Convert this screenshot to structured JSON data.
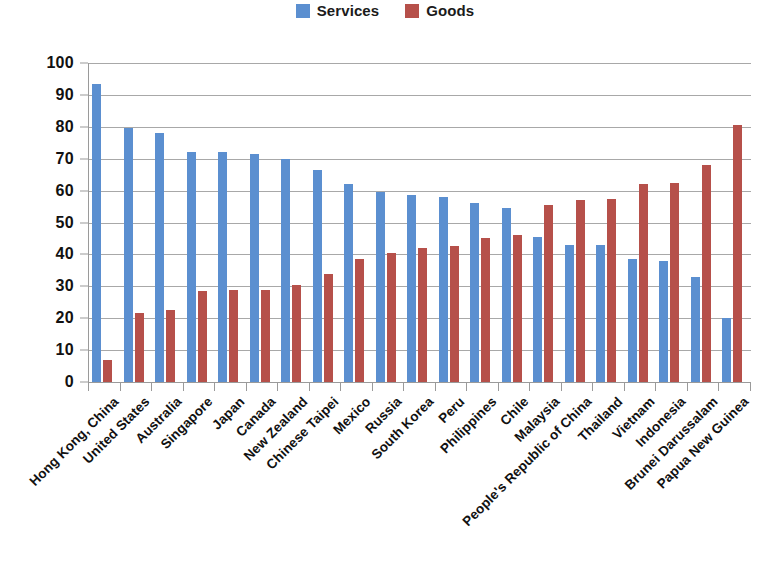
{
  "legend": {
    "position": "top-center",
    "entries": [
      {
        "label": "Services",
        "color": "#5b8fd0",
        "icon": "square-swatch"
      },
      {
        "label": "Goods",
        "color": "#b6504a",
        "icon": "square-swatch"
      }
    ]
  },
  "axis": {
    "y_ticks": [
      "0",
      "10",
      "20",
      "30",
      "40",
      "50",
      "60",
      "70",
      "80",
      "90",
      "100"
    ]
  },
  "chart_data": {
    "type": "bar",
    "title": "",
    "subtitle": "",
    "xlabel": "",
    "ylabel": "",
    "ylim": [
      0,
      100
    ],
    "ytick_step": 10,
    "grid": true,
    "legend_position": "top-center",
    "orientation": "vertical",
    "grouping": "grouped",
    "categories": [
      "Hong Kong, China",
      "United States",
      "Australia",
      "Singapore",
      "Japan",
      "Canada",
      "New Zealand",
      "Chinese Taipei",
      "Mexico",
      "Russia",
      "South Korea",
      "Peru",
      "Philippines",
      "Chile",
      "Malaysia",
      "People's Republic of China",
      "Thailand",
      "Vietnam",
      "Indonesia",
      "Brunei Darussalam",
      "Papua New Guinea"
    ],
    "series": [
      {
        "name": "Services",
        "color": "#5b8fd0",
        "values": [
          93.5,
          79.5,
          78,
          72,
          72,
          71.5,
          70,
          66.5,
          62,
          59.5,
          58.5,
          58,
          56,
          54.5,
          45.5,
          43,
          43,
          38.5,
          38,
          33,
          20
        ]
      },
      {
        "name": "Goods",
        "color": "#b6504a",
        "values": [
          7,
          21.5,
          22.5,
          28.5,
          29,
          29,
          30.5,
          34,
          38.5,
          40.5,
          42,
          42.5,
          45,
          46,
          55.5,
          57,
          57.5,
          62,
          62.5,
          68,
          80.5
        ]
      }
    ]
  }
}
